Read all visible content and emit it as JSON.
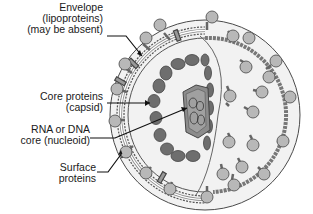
{
  "diagram": {
    "labels": [
      {
        "id": "envelope",
        "lines": [
          "Envelope",
          "(lipoproteins)",
          "(may be absent)"
        ]
      },
      {
        "id": "capsid",
        "lines": [
          "Core proteins",
          "(capsid)"
        ]
      },
      {
        "id": "nucleoid",
        "lines": [
          "RNA or DNA",
          "core (nucleoid)"
        ]
      },
      {
        "id": "surface",
        "lines": [
          "Surface",
          "proteins"
        ]
      }
    ],
    "colors": {
      "background": "#ffffff",
      "virion_fill": "#f2f2f2",
      "outline": "#4a4a4a",
      "spike_head": "#b8b8b8",
      "capsomere": "#6e6e6e",
      "nucleoid_fill": "#8c8c8c",
      "leader": "#111111"
    }
  }
}
